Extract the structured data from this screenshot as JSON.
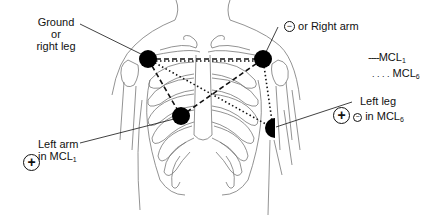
{
  "diagram": {
    "type": "ECG electrode placement on chest (MCL1 / MCL6 leads)",
    "electrodes": [
      {
        "id": "ground",
        "label_lines": [
          "Ground",
          "or",
          "right leg"
        ],
        "x": 148,
        "y": 59
      },
      {
        "id": "negative",
        "sign": "−",
        "label": "or Right arm",
        "x": 263,
        "y": 59
      },
      {
        "id": "left-arm",
        "label_lines": [
          "Left arm",
          "in MCL"
        ],
        "subscript": "1",
        "sign": "+",
        "x": 181,
        "y": 116
      },
      {
        "id": "left-leg",
        "label_lines": [
          "Left leg",
          "in MCL"
        ],
        "subscript": "6",
        "sign": "+",
        "small_sign": "−",
        "x": 273,
        "y": 128
      }
    ],
    "legend": [
      {
        "style": "dashed",
        "prefix": "----",
        "label": "MCL",
        "subscript": "1"
      },
      {
        "style": "dotted",
        "prefix": ". . . .",
        "label": "MCL",
        "subscript": "6"
      }
    ]
  },
  "labels": {
    "ground_l1": "Ground",
    "ground_l2": "or",
    "ground_l3": "right leg",
    "neg_sign": "−",
    "neg_text": "or Right arm",
    "leftarm_l1": "Left arm",
    "leftarm_l2": "in MCL",
    "leftarm_sub": "1",
    "leftarm_sign": "+",
    "leftleg_l1": "Left leg",
    "leftleg_sign": "+",
    "leftleg_small_sign": "−",
    "leftleg_l2": "in MCL",
    "leftleg_sub": "6",
    "legend_mcl1_prefix": "----",
    "legend_mcl1": "MCL",
    "legend_mcl1_sub": "1",
    "legend_mcl6_prefix": ". . . .",
    "legend_mcl6": "MCL",
    "legend_mcl6_sub": "6"
  }
}
